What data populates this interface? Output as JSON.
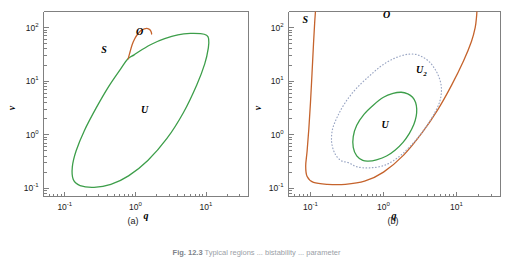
{
  "figure": {
    "caption_label": "Fig. 12.3",
    "caption_text": "Typical regions ... bistability ... parameter"
  },
  "panels": [
    {
      "id": "a",
      "caption": "(a)",
      "xlabel": "q",
      "ylabel": "v",
      "xticks": [
        "10-1",
        "100",
        "101"
      ],
      "yticks": [
        "10-1",
        "100",
        "101",
        "102"
      ],
      "region_labels": [
        {
          "text": "S",
          "sub": ""
        },
        {
          "text": "O",
          "sub": ""
        },
        {
          "text": "U",
          "sub": ""
        }
      ]
    },
    {
      "id": "b",
      "caption": "(b)",
      "xlabel": "q",
      "ylabel": "v",
      "xticks": [
        "10-1",
        "100",
        "101"
      ],
      "yticks": [
        "10-1",
        "100",
        "101",
        "102"
      ],
      "region_labels": [
        {
          "text": "S",
          "sub": ""
        },
        {
          "text": "O",
          "sub": ""
        },
        {
          "text": "U",
          "sub": "2"
        },
        {
          "text": "U",
          "sub": ""
        }
      ]
    }
  ],
  "colors": {
    "green": "#3d9e4a",
    "orange": "#c5632c",
    "blue_gray": "#9aa6c4",
    "axis": "#808080",
    "text": "#000000"
  },
  "chart_data": {
    "type": "line",
    "title": "",
    "xlabel": "q",
    "ylabel": "v",
    "xscale": "log",
    "yscale": "log",
    "grid": false,
    "legend": null,
    "panels": [
      {
        "name": "(a)",
        "xlim": [
          0.05,
          40
        ],
        "ylim": [
          0.07,
          200
        ],
        "annotations": [
          {
            "text": "S",
            "q": 0.36,
            "v": 33
          },
          {
            "text": "O",
            "q": 1.15,
            "v": 72
          },
          {
            "text": "U",
            "q": 1.35,
            "v": 2.6
          }
        ],
        "series": [
          {
            "name": "U-boundary",
            "color": "#3d9e4a",
            "style": "solid",
            "closed": true,
            "points_qv": [
              [
                0.78,
                26
              ],
              [
                0.62,
                17
              ],
              [
                0.42,
                8.0
              ],
              [
                0.28,
                3.2
              ],
              [
                0.19,
                1.2
              ],
              [
                0.145,
                0.5
              ],
              [
                0.128,
                0.25
              ],
              [
                0.132,
                0.145
              ],
              [
                0.165,
                0.112
              ],
              [
                0.26,
                0.104
              ],
              [
                0.45,
                0.118
              ],
              [
                0.8,
                0.17
              ],
              [
                1.5,
                0.33
              ],
              [
                2.8,
                0.85
              ],
              [
                4.8,
                2.6
              ],
              [
                7.4,
                8.5
              ],
              [
                9.6,
                21
              ],
              [
                10.8,
                42
              ],
              [
                10.9,
                62
              ],
              [
                10.2,
                72
              ],
              [
                8.4,
                77
              ],
              [
                6.0,
                78
              ],
              [
                4.0,
                73
              ],
              [
                2.6,
                62
              ],
              [
                1.75,
                50
              ],
              [
                1.25,
                39
              ],
              [
                0.96,
                31
              ],
              [
                0.78,
                26
              ]
            ]
          },
          {
            "name": "O-boundary",
            "color": "#c5632c",
            "style": "solid",
            "closed": false,
            "points_qv": [
              [
                0.79,
                26
              ],
              [
                0.84,
                35
              ],
              [
                0.9,
                48
              ],
              [
                0.98,
                62
              ],
              [
                1.08,
                76
              ],
              [
                1.2,
                88
              ],
              [
                1.34,
                95
              ],
              [
                1.5,
                96
              ],
              [
                1.62,
                90
              ],
              [
                1.68,
                82
              ],
              [
                1.7,
                76
              ]
            ]
          }
        ]
      },
      {
        "name": "(b)",
        "xlim": [
          0.05,
          40
        ],
        "ylim": [
          0.07,
          200
        ],
        "annotations": [
          {
            "text": "S",
            "q": 0.085,
            "v": 120
          },
          {
            "text": "O",
            "q": 1.1,
            "v": 150
          },
          {
            "text": "U2",
            "q": 3.3,
            "v": 14
          },
          {
            "text": "U",
            "q": 1.05,
            "v": 1.35
          }
        ],
        "series": [
          {
            "name": "S-boundary-left",
            "color": "#c5632c",
            "style": "solid",
            "closed": false,
            "points_qv": [
              [
                0.117,
                200
              ],
              [
                0.114,
                120
              ],
              [
                0.11,
                50
              ],
              [
                0.105,
                14
              ],
              [
                0.1,
                4.0
              ],
              [
                0.095,
                1.3
              ],
              [
                0.09,
                0.5
              ],
              [
                0.086,
                0.26
              ],
              [
                0.09,
                0.165
              ],
              [
                0.11,
                0.128
              ],
              [
                0.17,
                0.118
              ],
              [
                0.3,
                0.118
              ],
              [
                0.55,
                0.135
              ],
              [
                1.0,
                0.2
              ],
              [
                1.9,
                0.42
              ],
              [
                3.4,
                1.1
              ],
              [
                5.6,
                3.0
              ],
              [
                8.6,
                8.5
              ],
              [
                12.5,
                24
              ],
              [
                16.0,
                55
              ],
              [
                18.0,
                100
              ],
              [
                18.8,
                160
              ],
              [
                19.0,
                200
              ]
            ]
          },
          {
            "name": "U2-boundary",
            "color": "#9aa6c4",
            "style": "dotted",
            "closed": true,
            "points_qv": [
              [
                0.33,
                0.3
              ],
              [
                0.26,
                0.33
              ],
              [
                0.215,
                0.45
              ],
              [
                0.195,
                0.72
              ],
              [
                0.2,
                1.25
              ],
              [
                0.235,
                2.2
              ],
              [
                0.3,
                4.0
              ],
              [
                0.42,
                7.2
              ],
              [
                0.62,
                12
              ],
              [
                0.92,
                19
              ],
              [
                1.35,
                26
              ],
              [
                1.95,
                31
              ],
              [
                2.6,
                32
              ],
              [
                3.3,
                29
              ],
              [
                4.1,
                24
              ],
              [
                4.9,
                18
              ],
              [
                5.6,
                13
              ],
              [
                6.1,
                9.0
              ],
              [
                6.2,
                6.2
              ],
              [
                5.9,
                4.2
              ],
              [
                5.2,
                2.8
              ],
              [
                4.2,
                1.7
              ],
              [
                3.2,
                1.0
              ],
              [
                2.3,
                0.6
              ],
              [
                1.6,
                0.38
              ],
              [
                1.05,
                0.27
              ],
              [
                0.66,
                0.24
              ],
              [
                0.44,
                0.25
              ],
              [
                0.33,
                0.3
              ]
            ]
          },
          {
            "name": "U-boundary",
            "color": "#3d9e4a",
            "style": "solid",
            "closed": true,
            "points_qv": [
              [
                0.52,
                0.33
              ],
              [
                0.43,
                0.4
              ],
              [
                0.385,
                0.58
              ],
              [
                0.385,
                0.92
              ],
              [
                0.43,
                1.5
              ],
              [
                0.54,
                2.4
              ],
              [
                0.73,
                3.6
              ],
              [
                1.0,
                5.0
              ],
              [
                1.35,
                5.9
              ],
              [
                1.75,
                6.2
              ],
              [
                2.15,
                5.8
              ],
              [
                2.5,
                5.0
              ],
              [
                2.75,
                4.0
              ],
              [
                2.85,
                3.0
              ],
              [
                2.8,
                2.2
              ],
              [
                2.6,
                1.55
              ],
              [
                2.25,
                1.05
              ],
              [
                1.85,
                0.72
              ],
              [
                1.45,
                0.52
              ],
              [
                1.1,
                0.4
              ],
              [
                0.8,
                0.34
              ],
              [
                0.62,
                0.32
              ],
              [
                0.52,
                0.33
              ]
            ]
          }
        ]
      }
    ]
  }
}
